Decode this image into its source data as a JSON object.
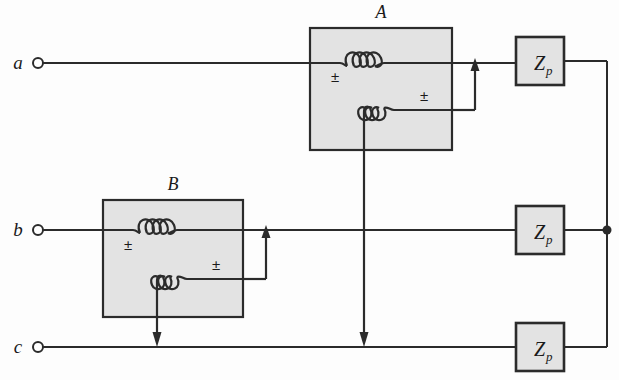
{
  "diagram": {
    "background_color": "#fdfdfd",
    "line_color": "#2b2b2b",
    "box_fill_color": "#e3e3e3",
    "box_stroke_color": "#2b2b2b"
  },
  "terminals": [
    {
      "label": "a",
      "x": 38,
      "y": 63
    },
    {
      "label": "b",
      "x": 38,
      "y": 230
    },
    {
      "label": "c",
      "x": 38,
      "y": 347
    }
  ],
  "transformers": [
    {
      "label": "A",
      "label_x": 381,
      "label_y": 18,
      "box": {
        "x": 310,
        "y": 28,
        "width": 142,
        "height": 122
      },
      "primary_polarity": "±",
      "secondary_polarity": "±",
      "primary_turns": 3,
      "secondary_turns": 3
    },
    {
      "label": "B",
      "label_x": 173,
      "label_y": 190,
      "box": {
        "x": 103,
        "y": 200,
        "width": 140,
        "height": 117
      },
      "primary_polarity": "±",
      "secondary_polarity": "±",
      "primary_turns": 3,
      "secondary_turns": 3
    }
  ],
  "loads": [
    {
      "label": "Z",
      "subscript": "p",
      "x": 516,
      "y": 37,
      "width": 48,
      "height": 48
    },
    {
      "label": "Z",
      "subscript": "p",
      "x": 516,
      "y": 206,
      "width": 48,
      "height": 48
    },
    {
      "label": "Z",
      "subscript": "p",
      "x": 516,
      "y": 323,
      "width": 48,
      "height": 48
    }
  ],
  "junction": {
    "x": 607,
    "y": 230,
    "radius": 4.5
  },
  "bus": {
    "x": 607,
    "y_top": 61,
    "y_bottom": 347
  }
}
